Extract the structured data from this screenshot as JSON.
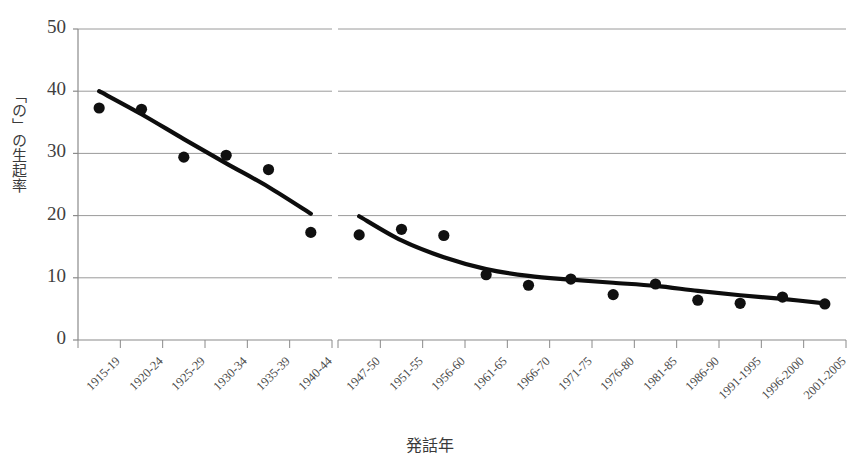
{
  "chart_data": {
    "type": "scatter",
    "title": "",
    "xlabel": "発話年",
    "ylabel": "「の」の生起率",
    "ylim": [
      0,
      50
    ],
    "yticks": [
      0,
      10,
      20,
      30,
      40,
      50
    ],
    "grid": true,
    "legend": "none",
    "axis_break": {
      "present": true,
      "between": [
        "1940-44",
        "1947-50"
      ],
      "note": "白い縦の切れ目（軸の中断）"
    },
    "categories": [
      "1915-19",
      "1920-24",
      "1925-29",
      "1930-34",
      "1935-39",
      "1940-44",
      "1947-50",
      "1951-55",
      "1956-60",
      "1961-65",
      "1966-70",
      "1971-75",
      "1976-80",
      "1981-85",
      "1986-90",
      "1991-1995",
      "1996-2000",
      "2001-2005"
    ],
    "series": [
      {
        "name": "「の」の生起率",
        "marker": "filled-circle",
        "color": "#101010",
        "values": [
          37.3,
          37.1,
          29.4,
          29.7,
          27.4,
          17.3,
          16.9,
          17.8,
          16.8,
          10.5,
          8.8,
          9.8,
          7.3,
          9.0,
          6.4,
          5.9,
          6.9,
          5.8
        ]
      }
    ],
    "trendlines": [
      {
        "name": "前半トレンド",
        "segment": "1915-19 〜 1940-44",
        "color": "#0d0d0d",
        "points": [
          {
            "x": "1915-19",
            "y": 40.0
          },
          {
            "x": "1920-24",
            "y": 36.3
          },
          {
            "x": "1925-29",
            "y": 32.3
          },
          {
            "x": "1930-34",
            "y": 28.4
          },
          {
            "x": "1935-39",
            "y": 24.6
          },
          {
            "x": "1940-44",
            "y": 20.3
          }
        ]
      },
      {
        "name": "後半トレンド",
        "segment": "1947-50 〜 2001-2005",
        "color": "#0d0d0d",
        "points": [
          {
            "x": "1947-50",
            "y": 19.9
          },
          {
            "x": "1951-55",
            "y": 16.0
          },
          {
            "x": "1956-60",
            "y": 13.3
          },
          {
            "x": "1961-65",
            "y": 11.4
          },
          {
            "x": "1966-70",
            "y": 10.3
          },
          {
            "x": "1971-75",
            "y": 9.7
          },
          {
            "x": "1976-80",
            "y": 9.2
          },
          {
            "x": "1981-85",
            "y": 8.7
          },
          {
            "x": "1986-90",
            "y": 7.9
          },
          {
            "x": "1991-1995",
            "y": 7.2
          },
          {
            "x": "1996-2000",
            "y": 6.6
          },
          {
            "x": "2001-2005",
            "y": 5.9
          }
        ]
      }
    ],
    "colors": {
      "marker": "#101010",
      "trendline": "#0d0d0d",
      "gridline": "#9a9a9a",
      "axis": "#8a8a8a",
      "background": "#ffffff",
      "text": "#3a3a3a"
    }
  }
}
